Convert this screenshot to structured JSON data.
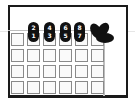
{
  "diagram": {
    "frame": {
      "border_color": "#1a1a1a"
    },
    "grid": {
      "rows": 4,
      "cols": 6,
      "cell_border_color": "#8a8a8a"
    },
    "pills": [
      {
        "top": "2",
        "bottom": "1"
      },
      {
        "top": "4",
        "bottom": "3"
      },
      {
        "top": "6",
        "bottom": "5"
      },
      {
        "top": "8",
        "bottom": "7"
      }
    ],
    "icon": "leaf-fan-icon"
  }
}
